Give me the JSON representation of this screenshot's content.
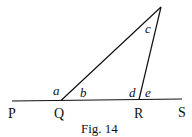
{
  "figure": {
    "caption": "Fig. 14",
    "points": {
      "P": "P",
      "Q": "Q",
      "R": "R",
      "S": "S"
    },
    "angles": {
      "a": "a",
      "b": "b",
      "c": "c",
      "d": "d",
      "e": "e"
    },
    "line_color": "#111111"
  }
}
